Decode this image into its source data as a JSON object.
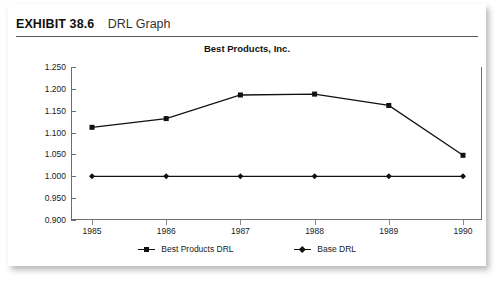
{
  "exhibit": {
    "label": "EXHIBIT 38.6",
    "title": "DRL Graph"
  },
  "legend": {
    "series1_label": "Best Products DRL",
    "series2_label": "Base DRL"
  },
  "chart_data": {
    "type": "line",
    "title": "Best Products, Inc.",
    "xlabel": "",
    "ylabel": "",
    "categories": [
      "1985",
      "1986",
      "1987",
      "1988",
      "1989",
      "1990"
    ],
    "ylim": [
      0.9,
      1.25
    ],
    "yticks": [
      "0.900",
      "0.950",
      "1.000",
      "1.050",
      "1.100",
      "1.150",
      "1.200",
      "1.250"
    ],
    "ytick_values": [
      0.9,
      0.95,
      1.0,
      1.05,
      1.1,
      1.15,
      1.2,
      1.25
    ],
    "grid": false,
    "legend_position": "bottom",
    "series": [
      {
        "name": "Best Products DRL",
        "marker": "square",
        "color": "#111111",
        "values": [
          1.112,
          1.132,
          1.186,
          1.188,
          1.162,
          1.048
        ]
      },
      {
        "name": "Base DRL",
        "marker": "diamond",
        "color": "#111111",
        "values": [
          1.0,
          1.0,
          1.0,
          1.0,
          1.0,
          1.0
        ]
      }
    ]
  }
}
